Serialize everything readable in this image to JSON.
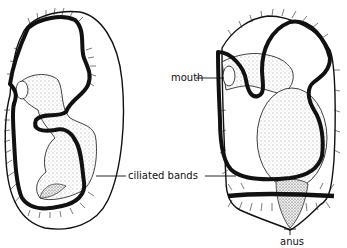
{
  "figure": {
    "labels": {
      "mouth": "mouth",
      "ciliated_bands": "ciliated bands",
      "anus": "anus"
    },
    "colors": {
      "ink": "#111111",
      "background": "#ffffff",
      "stipple": "#555555"
    }
  }
}
